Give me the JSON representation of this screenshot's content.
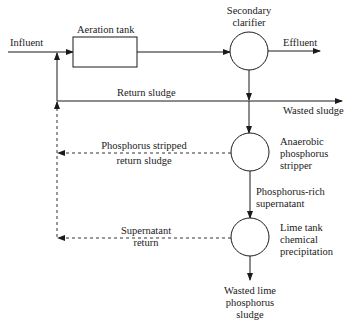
{
  "diagram": {
    "nodes": {
      "influent": "Influent",
      "aeration_tank": "Aeration tank",
      "secondary_clarifier": [
        "Secondary",
        "clarifier"
      ],
      "effluent": "Effluent",
      "return_sludge": "Return sludge",
      "wasted_sludge": "Wasted sludge",
      "anaerobic_stripper": [
        "Anaerobic",
        "phosphorus",
        "stripper"
      ],
      "p_stripped_return": [
        "Phosphorus stripped",
        "return sludge"
      ],
      "p_rich_supernatant": [
        "Phosphorus-rich",
        "supernatant"
      ],
      "lime_tank": [
        "Lime tank",
        "chemical",
        "precipitation"
      ],
      "supernatant_return": [
        "Supernatant",
        "return"
      ],
      "wasted_lime_sludge": [
        "Wasted lime",
        "phosphorus",
        "sludge"
      ]
    },
    "colors": {
      "line": "#1a1a1a",
      "dashed": "#333333",
      "background": "#ffffff"
    }
  }
}
